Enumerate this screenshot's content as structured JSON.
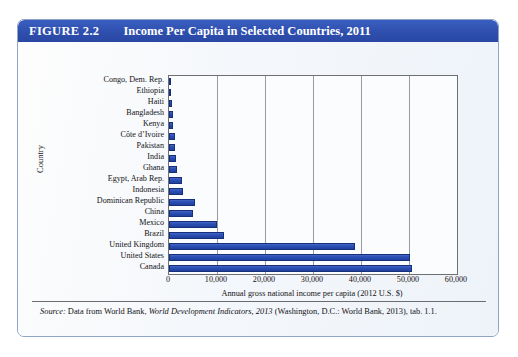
{
  "figure": {
    "number_label": "FIGURE 2.2",
    "title": "Income Per Capita in Selected Countries, 2011",
    "banner_color": "#2f4fae",
    "frame_border_color": "#8fa4c4"
  },
  "source_note": {
    "lead_in": "Source:",
    "text_part_1": " Data from World Bank, ",
    "italic_title": "World Development Indicators, 2013",
    "text_part_2": " (Washington, D.C.: World Bank, 2013), tab. 1.1."
  },
  "chart_data": {
    "type": "bar",
    "orientation": "horizontal",
    "title": "Income Per Capita in Selected Countries, 2011",
    "xlabel": "Annual gross national income per capita (2012 U.S. $)",
    "ylabel": "Country",
    "xlim": [
      0,
      60000
    ],
    "xticks": [
      0,
      10000,
      20000,
      30000,
      40000,
      50000,
      60000
    ],
    "xtick_labels": [
      "0",
      "10,000",
      "20,000",
      "30,000",
      "40,000",
      "50,000",
      "60,000"
    ],
    "grid": true,
    "grid_axis": "x",
    "legend": null,
    "bar_color": "#2a4fb5",
    "bar_edge_color": "#16307c",
    "categories": [
      "Congo, Dem. Rep.",
      "Ethiopia",
      "Haiti",
      "Bangladesh",
      "Kenya",
      "Côte d’Ivoire",
      "Pakistan",
      "India",
      "Ghana",
      "Egypt, Arab Rep.",
      "Indonesia",
      "Dominican Republic",
      "China",
      "Mexico",
      "Brazil",
      "United Kingdom",
      "United States",
      "Canada"
    ],
    "values": [
      400,
      400,
      700,
      800,
      850,
      1200,
      1250,
      1500,
      1600,
      2700,
      2950,
      5450,
      4900,
      10000,
      11500,
      38750,
      50200,
      50600
    ]
  }
}
